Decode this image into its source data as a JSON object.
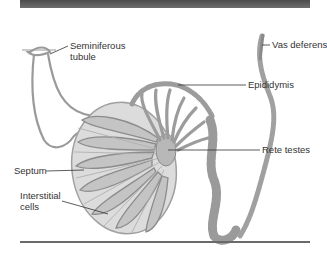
{
  "figure": {
    "colors": {
      "header_bar": "#555555",
      "tissue_fill": "#d9d9d9",
      "tubule_fill": "#a8a8a8",
      "tubule_stroke": "#888888",
      "leader_line": "#333333"
    },
    "labels": {
      "seminiferous_tubule_line1": "Seminiferous",
      "seminiferous_tubule_line2": "tubule",
      "vas_deferens": "Vas deferens",
      "epididymis": "Epididymis",
      "rete_testes": "Rete testes",
      "septum": "Septum",
      "interstitial_cells_line1": "Interstitial",
      "interstitial_cells_line2": "cells"
    }
  }
}
